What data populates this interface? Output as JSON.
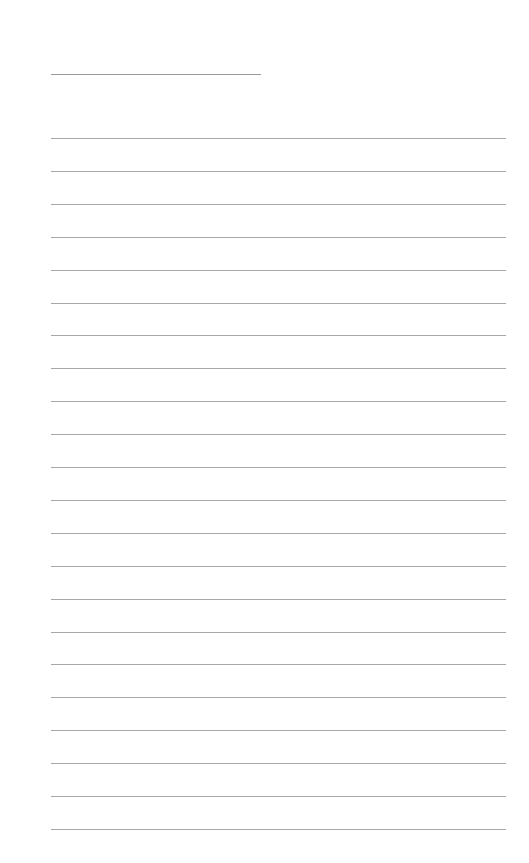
{
  "page": {
    "type": "lined-paper",
    "background_color": "#ffffff",
    "line_color": "#a8a8a8",
    "header_line": {
      "label": "",
      "x": 51,
      "y": 74,
      "width": 210
    },
    "ruled_lines": {
      "count": 22,
      "start_y": 138,
      "spacing": 32.9,
      "x": 51,
      "width": 455,
      "entries": [
        "",
        "",
        "",
        "",
        "",
        "",
        "",
        "",
        "",
        "",
        "",
        "",
        "",
        "",
        "",
        "",
        "",
        "",
        "",
        "",
        "",
        ""
      ]
    }
  }
}
